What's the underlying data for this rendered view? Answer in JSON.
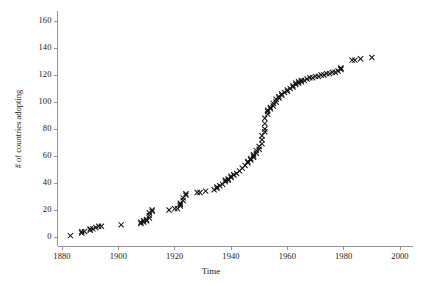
{
  "chart_data": {
    "type": "scatter",
    "title": "",
    "xlabel": "Time",
    "ylabel": "# of countries adopting",
    "xlim": [
      1876,
      2004
    ],
    "ylim": [
      -4,
      166
    ],
    "xticks": [
      1880,
      1900,
      1920,
      1940,
      1960,
      1980,
      2000
    ],
    "xtick_labels": [
      "1880",
      "1900",
      "1920",
      "1940",
      "1960",
      "1980",
      "2000"
    ],
    "yticks": [
      0,
      20,
      40,
      60,
      80,
      100,
      120,
      140,
      160
    ],
    "ytick_labels": [
      "0",
      "20",
      "40",
      "60",
      "80",
      "100",
      "120",
      "140",
      "160"
    ],
    "grid": false,
    "legend": null,
    "marker": "x",
    "marker_color": "#111111",
    "marker_size": 2.6,
    "axis_color": "#8a8a8a",
    "background": "#ffffff",
    "series": [
      {
        "name": "cumulative countries adopting",
        "x": [
          1883,
          1887,
          1887,
          1888,
          1890,
          1890,
          1891,
          1892,
          1893,
          1894,
          1901,
          1908,
          1908,
          1909,
          1909,
          1910,
          1910,
          1911,
          1911,
          1911,
          1912,
          1912,
          1918,
          1920,
          1921,
          1922,
          1922,
          1922,
          1923,
          1923,
          1924,
          1924,
          1928,
          1929,
          1931,
          1934,
          1935,
          1935,
          1936,
          1937,
          1938,
          1938,
          1939,
          1939,
          1940,
          1940,
          1941,
          1941,
          1942,
          1943,
          1944,
          1945,
          1946,
          1946,
          1947,
          1947,
          1948,
          1948,
          1948,
          1949,
          1949,
          1950,
          1950,
          1951,
          1951,
          1951,
          1952,
          1952,
          1952,
          1952,
          1953,
          1953,
          1953,
          1954,
          1954,
          1955,
          1955,
          1956,
          1956,
          1957,
          1957,
          1958,
          1958,
          1959,
          1960,
          1960,
          1961,
          1962,
          1962,
          1963,
          1963,
          1964,
          1964,
          1965,
          1965,
          1966,
          1967,
          1968,
          1969,
          1970,
          1971,
          1972,
          1973,
          1974,
          1975,
          1976,
          1977,
          1978,
          1979,
          1979,
          1979,
          1983,
          1984,
          1986,
          1990
        ],
        "y": [
          1,
          3,
          4,
          4,
          5,
          6,
          6,
          7,
          8,
          8,
          9,
          10,
          11,
          11,
          12,
          12,
          13,
          14,
          16,
          18,
          19,
          20,
          20,
          21,
          21,
          23,
          24,
          25,
          27,
          29,
          31,
          32,
          33,
          33,
          34,
          35,
          36,
          37,
          38,
          39,
          41,
          42,
          42,
          43,
          44,
          45,
          46,
          46,
          47,
          49,
          51,
          53,
          55,
          56,
          57,
          58,
          59,
          60,
          61,
          62,
          64,
          65,
          67,
          69,
          72,
          75,
          78,
          80,
          84,
          88,
          91,
          93,
          94,
          95,
          96,
          97,
          99,
          100,
          102,
          103,
          104,
          105,
          106,
          107,
          108,
          109,
          110,
          111,
          112,
          113,
          114,
          114,
          115,
          115,
          116,
          116,
          117,
          118,
          118,
          119,
          119,
          120,
          120,
          121,
          121,
          122,
          122,
          123,
          124,
          125,
          125,
          131,
          131,
          132,
          133
        ]
      }
    ]
  },
  "axis_titles": {
    "x": "Time",
    "y": "# of countries adopting"
  }
}
